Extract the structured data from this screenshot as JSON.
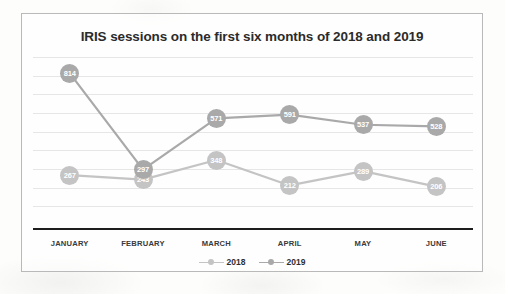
{
  "chart_data": {
    "type": "line",
    "title": "IRIS sessions on the first six months of 2018 and 2019",
    "xlabel": "",
    "ylabel": "",
    "categories": [
      "JANUARY",
      "FEBRUARY",
      "MARCH",
      "APRIL",
      "MAY",
      "JUNE"
    ],
    "series": [
      {
        "name": "2018",
        "color": "#c4c4c4",
        "values": [
          267,
          243,
          348,
          212,
          289,
          206
        ],
        "labels": [
          "267",
          "243",
          "348",
          "212",
          "289",
          "206"
        ]
      },
      {
        "name": "2019",
        "color": "#a9a9a9",
        "values": [
          814,
          297,
          571,
          591,
          537,
          528
        ],
        "labels": [
          "814",
          "297",
          "571",
          "591",
          "537",
          "528"
        ]
      }
    ],
    "ylim": [
      0,
      900
    ],
    "grid": true,
    "gridline_values": [
      900,
      800,
      700,
      600,
      500,
      400,
      300,
      200,
      100
    ],
    "legend_position": "bottom",
    "data_labels": true,
    "axis_baseline_color": "#1d1d1d",
    "gridline_color": "#e6e6e6",
    "frame_color": "#b9b9b9",
    "page_background": "#fdfdfc",
    "title_color": "#2b2b2b"
  },
  "legend": {
    "items": [
      {
        "label": "2018"
      },
      {
        "label": "2019"
      }
    ]
  }
}
